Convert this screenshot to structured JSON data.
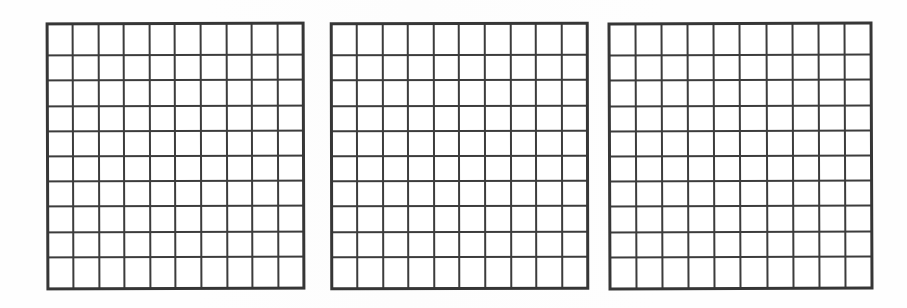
{
  "page": {
    "width": 907,
    "height": 308,
    "background_color": "#fefefe",
    "line_color": "#3c3c3c",
    "outer_border_color": "#363636",
    "cell_fill_color": "#ffffff"
  },
  "figures": [
    {
      "name": "grid-1",
      "label": "",
      "rows": 10,
      "columns": 10,
      "cell_count": 100,
      "filled_cells": 0,
      "cell_values": [
        [
          "",
          "",
          "",
          "",
          "",
          "",
          "",
          "",
          "",
          ""
        ],
        [
          "",
          "",
          "",
          "",
          "",
          "",
          "",
          "",
          "",
          ""
        ],
        [
          "",
          "",
          "",
          "",
          "",
          "",
          "",
          "",
          "",
          ""
        ],
        [
          "",
          "",
          "",
          "",
          "",
          "",
          "",
          "",
          "",
          ""
        ],
        [
          "",
          "",
          "",
          "",
          "",
          "",
          "",
          "",
          "",
          ""
        ],
        [
          "",
          "",
          "",
          "",
          "",
          "",
          "",
          "",
          "",
          ""
        ],
        [
          "",
          "",
          "",
          "",
          "",
          "",
          "",
          "",
          "",
          ""
        ],
        [
          "",
          "",
          "",
          "",
          "",
          "",
          "",
          "",
          "",
          ""
        ],
        [
          "",
          "",
          "",
          "",
          "",
          "",
          "",
          "",
          "",
          ""
        ],
        [
          "",
          "",
          "",
          "",
          "",
          "",
          "",
          "",
          "",
          ""
        ]
      ],
      "geometry": {
        "left": 46,
        "top": 22,
        "width": 259,
        "height": 268
      }
    },
    {
      "name": "grid-2",
      "label": "",
      "rows": 10,
      "columns": 10,
      "cell_count": 100,
      "filled_cells": 0,
      "cell_values": [
        [
          "",
          "",
          "",
          "",
          "",
          "",
          "",
          "",
          "",
          ""
        ],
        [
          "",
          "",
          "",
          "",
          "",
          "",
          "",
          "",
          "",
          ""
        ],
        [
          "",
          "",
          "",
          "",
          "",
          "",
          "",
          "",
          "",
          ""
        ],
        [
          "",
          "",
          "",
          "",
          "",
          "",
          "",
          "",
          "",
          ""
        ],
        [
          "",
          "",
          "",
          "",
          "",
          "",
          "",
          "",
          "",
          ""
        ],
        [
          "",
          "",
          "",
          "",
          "",
          "",
          "",
          "",
          "",
          ""
        ],
        [
          "",
          "",
          "",
          "",
          "",
          "",
          "",
          "",
          "",
          ""
        ],
        [
          "",
          "",
          "",
          "",
          "",
          "",
          "",
          "",
          "",
          ""
        ],
        [
          "",
          "",
          "",
          "",
          "",
          "",
          "",
          "",
          "",
          ""
        ],
        [
          "",
          "",
          "",
          "",
          "",
          "",
          "",
          "",
          "",
          ""
        ]
      ],
      "geometry": {
        "left": 330,
        "top": 22,
        "width": 259,
        "height": 268
      }
    },
    {
      "name": "grid-3",
      "label": "",
      "rows": 10,
      "columns": 10,
      "cell_count": 100,
      "filled_cells": 0,
      "cell_values": [
        [
          "",
          "",
          "",
          "",
          "",
          "",
          "",
          "",
          "",
          ""
        ],
        [
          "",
          "",
          "",
          "",
          "",
          "",
          "",
          "",
          "",
          ""
        ],
        [
          "",
          "",
          "",
          "",
          "",
          "",
          "",
          "",
          "",
          ""
        ],
        [
          "",
          "",
          "",
          "",
          "",
          "",
          "",
          "",
          "",
          ""
        ],
        [
          "",
          "",
          "",
          "",
          "",
          "",
          "",
          "",
          "",
          ""
        ],
        [
          "",
          "",
          "",
          "",
          "",
          "",
          "",
          "",
          "",
          ""
        ],
        [
          "",
          "",
          "",
          "",
          "",
          "",
          "",
          "",
          "",
          ""
        ],
        [
          "",
          "",
          "",
          "",
          "",
          "",
          "",
          "",
          "",
          ""
        ],
        [
          "",
          "",
          "",
          "",
          "",
          "",
          "",
          "",
          "",
          ""
        ],
        [
          "",
          "",
          "",
          "",
          "",
          "",
          "",
          "",
          "",
          ""
        ]
      ],
      "geometry": {
        "left": 608,
        "top": 22,
        "width": 265,
        "height": 268
      }
    }
  ]
}
